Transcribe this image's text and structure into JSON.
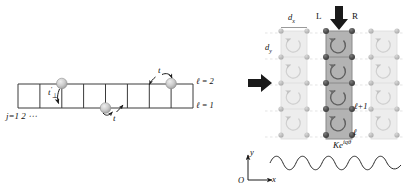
{
  "figure": {
    "domain": "physics-lattice-diagram",
    "panels": [
      "left-ladder",
      "right-flux-lattice"
    ]
  },
  "left_panel": {
    "name": "two-leg-ladder",
    "rungs": 8,
    "legs": 2,
    "site_label": "j=1 2 ⋯",
    "site_label_parts": {
      "j": "j",
      "eq": "=",
      "one": "1",
      "two": "2",
      "dots": "⋯"
    },
    "leg_labels": [
      {
        "text": "ℓ = 2",
        "rail": "upper"
      },
      {
        "text": "ℓ = 1",
        "rail": "lower"
      }
    ],
    "hopping_labels": [
      {
        "text": "t′⊥",
        "symbol": "t",
        "prime": "′",
        "sub": "⊥",
        "role": "rung-hopping"
      },
      {
        "text": "t",
        "symbol": "t",
        "role": "leg-hopping-lower"
      },
      {
        "text": "t",
        "symbol": "t",
        "role": "leg-hopping-upper"
      }
    ],
    "particles": [
      {
        "id": "p1",
        "leg": 2,
        "note": "upper-left particle"
      },
      {
        "id": "p2",
        "leg": 1,
        "note": "lower-middle particle"
      },
      {
        "id": "p3",
        "leg": 2,
        "note": "upper-right particle"
      }
    ],
    "colors": {
      "lattice_line": "#3a3a3a",
      "particle_fill": "#c9c9c9",
      "particle_edge": "#8a8a8a",
      "arrow": "#1a1a1a"
    }
  },
  "right_panel": {
    "name": "flux-lattice-columns",
    "columns": 3,
    "plaquettes_per_column": 4,
    "highlighted_column_index": 1,
    "spacing_labels": [
      {
        "text": "dₓ",
        "base": "d",
        "sub": "x",
        "role": "x-lattice-spacing"
      },
      {
        "text": "dᵧ",
        "base": "d",
        "sub": "y",
        "role": "y-lattice-spacing"
      }
    ],
    "chirality_labels": [
      {
        "text": "L",
        "side": "left"
      },
      {
        "text": "R",
        "side": "right"
      }
    ],
    "rung_index_labels": [
      {
        "text": "ℓ+1"
      },
      {
        "text": "ℓ"
      }
    ],
    "coupling_label": {
      "text": "Keⁱᶠᵒ",
      "base": "K",
      "exponent": "e",
      "phase": "iqθ"
    },
    "axes": {
      "origin": "O",
      "x": "x",
      "y": "y"
    },
    "arrows": [
      {
        "direction": "down",
        "role": "top-incoming-beam"
      },
      {
        "direction": "right",
        "role": "left-incoming-beam"
      }
    ],
    "plaquette_circulation": "counterclockwise",
    "colors": {
      "site_dark": "#4d4d4d",
      "site_light": "#b8b8b8",
      "column_highlight_fill": "#b3b3b3",
      "column_faded_fill": "#e4e4e4",
      "circ_arrow_dark": "#6b6b6b",
      "circ_arrow_light": "#cfcfcf",
      "grid_dash": "#d5d5d5",
      "wave": "#2b2b2b",
      "block_arrow": "#1a1a1a"
    }
  }
}
